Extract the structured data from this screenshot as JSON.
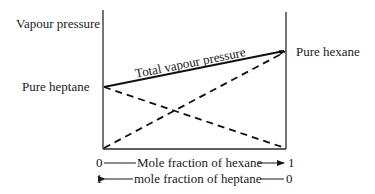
{
  "diagram": {
    "type": "vapour-pressure-composition",
    "y_axis_label": "Vapour pressure",
    "left_point_label": "Pure heptane",
    "right_point_label": "Pure hexane",
    "total_line_label": "Total vapour pressure",
    "x_axis": {
      "row1": {
        "left_value": "0",
        "label": "Mole fraction of hexane",
        "right_value": "1",
        "arrow_direction": "right"
      },
      "row2": {
        "left_value": "1",
        "label": "mole fraction of heptane",
        "right_value": "0",
        "arrow_direction": "left"
      }
    },
    "lines": [
      {
        "name": "total vapour pressure",
        "style": "solid",
        "from": "pure heptane",
        "to": "pure hexane"
      },
      {
        "name": "heptane partial pressure",
        "style": "dashed",
        "from": "pure heptane",
        "to": "zero at right"
      },
      {
        "name": "hexane partial pressure",
        "style": "dashed",
        "from": "zero at left",
        "to": "pure hexane"
      }
    ],
    "colors": {
      "ink": "#1a1a1a",
      "background": "#ffffff"
    }
  }
}
